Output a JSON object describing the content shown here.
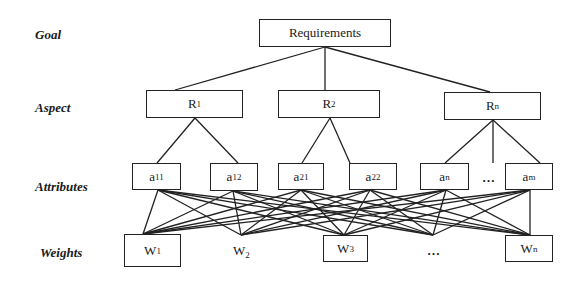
{
  "diagram": {
    "type": "hierarchy",
    "levels": [
      {
        "id": "goal",
        "label": "Goal"
      },
      {
        "id": "aspect",
        "label": "Aspect"
      },
      {
        "id": "attributes",
        "label": "Attributes"
      },
      {
        "id": "weights",
        "label": "Weights"
      }
    ],
    "goal": {
      "label": "Requirements"
    },
    "aspects": [
      {
        "base": "R",
        "sub": "1"
      },
      {
        "base": "R",
        "sub": "2"
      },
      {
        "base": "R",
        "sub": "n"
      }
    ],
    "attributes": [
      {
        "base": "a",
        "sub": "11",
        "parent": "R1"
      },
      {
        "base": "a",
        "sub": "12",
        "parent": "R1"
      },
      {
        "base": "a",
        "sub": "21",
        "parent": "R2"
      },
      {
        "base": "a",
        "sub": "22",
        "parent": "R2"
      },
      {
        "base": "a",
        "sub": "n",
        "parent": "Rn"
      },
      {
        "base": "a",
        "sub": "m",
        "parent": "Rn"
      }
    ],
    "attribute_ellipsis": "…",
    "weights": [
      {
        "base": "W",
        "sub": "1",
        "boxed": true
      },
      {
        "base": "W",
        "sub": "2",
        "boxed": false
      },
      {
        "base": "W",
        "sub": "3",
        "boxed": true
      },
      {
        "base": "W",
        "sub": "n",
        "boxed": true
      }
    ],
    "weight_ellipsis": "…",
    "edges_note": "every attribute connects to every weight node (fully connected bipartite)"
  }
}
